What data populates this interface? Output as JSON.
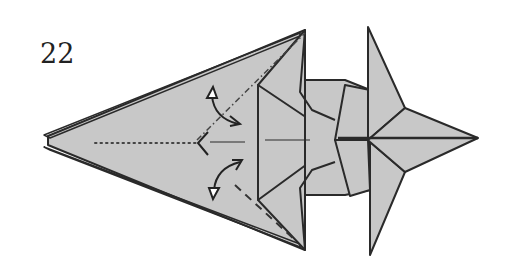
{
  "step": {
    "number": "22"
  },
  "diagram": {
    "paper_color": "#c8c8c8",
    "line_color": "#2a2a2a",
    "annotations": [
      {
        "type": "valley-fold-line",
        "style": "dotted",
        "location": "left-center horizontal"
      },
      {
        "type": "mountain-fold-line",
        "style": "dash-dot",
        "location": "upper diagonal"
      },
      {
        "type": "fold-line",
        "style": "dashed",
        "location": "lower diagonal"
      },
      {
        "type": "fold-arrow",
        "direction": "up-out",
        "location": "upper"
      },
      {
        "type": "fold-arrow",
        "direction": "down-out",
        "location": "lower"
      }
    ]
  }
}
